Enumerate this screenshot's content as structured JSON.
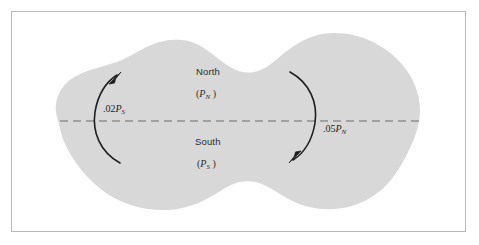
{
  "figure": {
    "type": "region-partition-diagram",
    "background_color": "#ffffff",
    "frame_color": "#b9b9b9",
    "blob_fill_color": "#d8d8d8",
    "line_color": "#1e1e1e",
    "dashed_line_color": "#8f8f8f"
  },
  "regions": {
    "north": {
      "name": "North",
      "symbol_open": "(",
      "symbol_var": "P",
      "symbol_sub": "N",
      "symbol_close": " )"
    },
    "south": {
      "name": "South",
      "symbol_open": "(",
      "symbol_var": "P",
      "symbol_sub": "S",
      "symbol_close": " )"
    }
  },
  "flows": [
    {
      "id": "north-to-south",
      "label_prefix": ".02",
      "label_var": "P",
      "label_sub": "S",
      "direction": "counterclockwise-up",
      "side": "left"
    },
    {
      "id": "south-to-north",
      "label_prefix": ".05",
      "label_var": "P",
      "label_sub": "N",
      "direction": "clockwise-down",
      "side": "right"
    }
  ],
  "divider": {
    "style": "dashed",
    "orientation": "horizontal"
  }
}
